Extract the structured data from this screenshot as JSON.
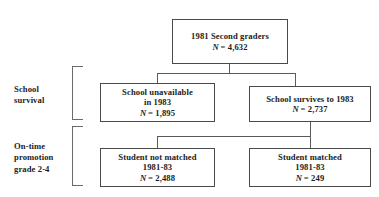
{
  "diagram": {
    "type": "flowchart",
    "nodes": [
      {
        "id": "cohort",
        "lines": [
          "1981 Second graders"
        ],
        "n_label": "N",
        "n_value": "= 4,632"
      },
      {
        "id": "school-unavailable",
        "lines": [
          "School unavailable",
          "in 1983"
        ],
        "n_label": "N",
        "n_value": "= 1,895"
      },
      {
        "id": "school-survives",
        "lines": [
          "School survives to 1983"
        ],
        "n_label": "N",
        "n_value": "= 2,737"
      },
      {
        "id": "student-not-matched",
        "lines": [
          "Student not matched",
          "1981-83"
        ],
        "n_label": "N",
        "n_value": "= 2,488"
      },
      {
        "id": "student-matched",
        "lines": [
          "Student matched",
          "1981-83"
        ],
        "n_label": "N",
        "n_value": "= 249"
      }
    ],
    "stages": [
      {
        "id": "school-survival",
        "lines": [
          "School",
          "survival"
        ]
      },
      {
        "id": "on-time-promotion",
        "lines": [
          "On-time",
          "promotion",
          "grade 2-4"
        ]
      }
    ],
    "colors": {
      "background": "#ffffff",
      "box_border": "#4a4a4a",
      "connector": "#5a5a5a",
      "bracket": "#6a6a6a",
      "text": "#1c1c1c"
    }
  }
}
